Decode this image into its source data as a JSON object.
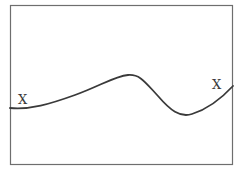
{
  "diagram": {
    "labels": {
      "left": "X",
      "right": "X"
    },
    "frame": {
      "stroke_color": "#6e6e6e"
    },
    "curve": {
      "stroke_color": "#3a3a3a",
      "description": "smooth wave rising from left to a peak, dipping to a trough, then rising to the right"
    }
  }
}
